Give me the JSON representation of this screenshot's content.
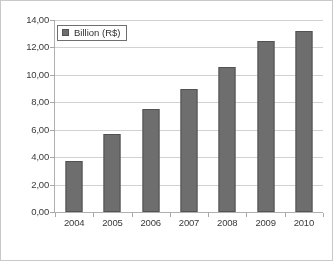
{
  "chart_data": {
    "type": "bar",
    "title": "",
    "xlabel": "",
    "ylabel": "",
    "categories": [
      "2004",
      "2005",
      "2006",
      "2007",
      "2008",
      "2009",
      "2010"
    ],
    "values": [
      3.7,
      5.7,
      7.5,
      8.95,
      10.6,
      12.5,
      13.2
    ],
    "series": [
      {
        "name": "Billion (R$)",
        "values": [
          3.7,
          5.7,
          7.5,
          8.95,
          10.6,
          12.5,
          13.2
        ]
      }
    ],
    "ylim": [
      0,
      14
    ],
    "ytick_step": 2,
    "ytick_labels": [
      "0,00",
      "2,00",
      "4,00",
      "6,00",
      "8,00",
      "10,00",
      "12,00",
      "14,00"
    ],
    "ytick_values": [
      0,
      2,
      4,
      6,
      8,
      10,
      12,
      14
    ],
    "grid": true,
    "legend_position": "top-left",
    "decimal_separator": ",",
    "bar_color": "#6e6e6e",
    "bar_border_color": "#525252",
    "gridline_color": "#d2d2d2",
    "axis_color": "#b0b0b0"
  },
  "legend": {
    "label": "Billion (R$)",
    "swatch_name": "legend-color-swatch"
  }
}
